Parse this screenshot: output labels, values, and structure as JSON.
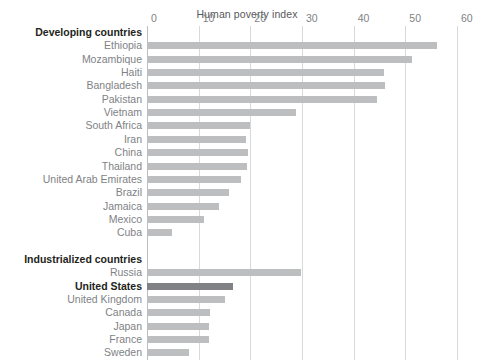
{
  "chart_data": {
    "type": "bar",
    "orientation": "horizontal",
    "title": "Human poverty index",
    "xlabel": "",
    "ylabel": "",
    "xlim": [
      0,
      60
    ],
    "xticks": [
      0,
      10,
      20,
      30,
      40,
      50,
      60
    ],
    "grid": true,
    "legend": "none",
    "axis_position": "top",
    "groups": [
      {
        "heading": "Developing countries",
        "categories": [
          "Ethiopia",
          "Mozambique",
          "Haiti",
          "Bangladesh",
          "Pakistan",
          "Vietnam",
          "South Africa",
          "Iran",
          "China",
          "Thailand",
          "United Arab Emirates",
          "Brazil",
          "Jamaica",
          "Mexico",
          "Cuba"
        ],
        "values": [
          56.2,
          51.2,
          45.8,
          46.0,
          44.5,
          28.8,
          20.0,
          19.2,
          19.6,
          19.4,
          18.2,
          15.8,
          13.9,
          11.0,
          4.9
        ],
        "highlight": []
      },
      {
        "heading": "Industrialized countries",
        "categories": [
          "Russia",
          "United States",
          "United Kingdom",
          "Canada",
          "Japan",
          "France",
          "Sweden"
        ],
        "values": [
          29.8,
          16.7,
          15.1,
          12.2,
          12.0,
          12.0,
          8.2
        ],
        "highlight": [
          "United States"
        ]
      }
    ],
    "colors": {
      "bar": "#bcbec0",
      "bar_highlight": "#808285",
      "grid": "#d9d9d9",
      "axis": "#bdbdbd",
      "label": "#808285",
      "label_bold": "#231f20"
    }
  }
}
